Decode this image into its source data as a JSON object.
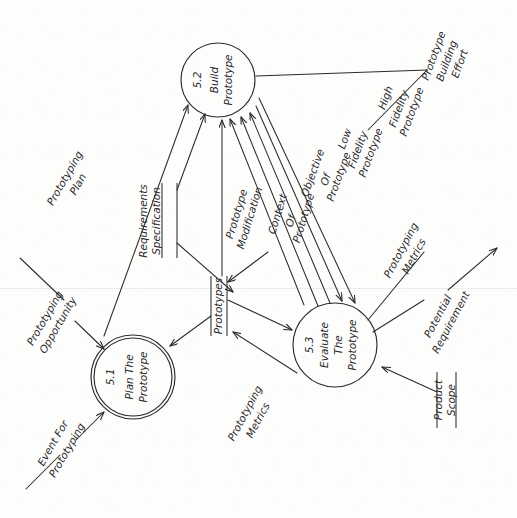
{
  "diagram": {
    "type": "data-flow-diagram",
    "orientation": "rotated-90-clockwise",
    "processes": [
      {
        "id": "5.1",
        "name_lines": [
          "Plan The",
          "Prototype"
        ],
        "shape": "double-circle",
        "cx": 133,
        "cy": 377,
        "r": 42
      },
      {
        "id": "5.2",
        "name_lines": [
          "Build",
          "Prototype"
        ],
        "shape": "circle",
        "cx": 218,
        "cy": 80,
        "r": 37
      },
      {
        "id": "5.3",
        "name_lines": [
          "Evaluate",
          "The",
          "Prototype"
        ],
        "shape": "circle",
        "cx": 335,
        "cy": 345,
        "r": 42
      }
    ],
    "data_stores": [
      {
        "name_lines": [
          "Requirements",
          "Specification"
        ],
        "x": 168,
        "y_top": 183,
        "y_bottom": 258
      },
      {
        "name_lines": [
          "Prototypes"
        ],
        "x": 218,
        "y_top": 276,
        "y_bottom": 336
      },
      {
        "name_lines": [
          "Product",
          "Scope"
        ],
        "x": 445,
        "y_top": 372,
        "y_bottom": 428
      }
    ],
    "flows": [
      {
        "label_lines": [
          "Prototyping",
          "Plan"
        ],
        "from": "5.1",
        "to": "5.2"
      },
      {
        "label_lines": [
          "Prototyping",
          "Opportunity"
        ],
        "from": "external",
        "to": "5.1"
      },
      {
        "label_lines": [
          "Event For",
          "Prototyping"
        ],
        "from": "external",
        "to": "5.1"
      },
      {
        "label_lines": [
          "Prototype",
          "Modification"
        ],
        "from": "5.3",
        "to": "5.2"
      },
      {
        "label_lines": [
          "Context",
          "Of",
          "Prototype"
        ],
        "from": "5.3",
        "to": "5.2"
      },
      {
        "label_lines": [
          "Objective",
          "Of",
          "Prototype"
        ],
        "from": "5.3",
        "to": "5.2"
      },
      {
        "label_lines": [
          "Low",
          "Fidelity",
          "Prototype"
        ],
        "from": "5.2",
        "to": "5.3"
      },
      {
        "label_lines": [
          "High",
          "Fidelity",
          "Prototype"
        ],
        "from": "5.2",
        "to": "5.3"
      },
      {
        "label_lines": [
          "Prototype",
          "Building",
          "Effort"
        ],
        "from": "5.2",
        "to": "external"
      },
      {
        "label_lines": [
          "Prototyping",
          "Metrics"
        ],
        "from": "5.3",
        "to": "external"
      },
      {
        "label_lines": [
          "Potential",
          "Requirement"
        ],
        "from": "5.3",
        "to": "external"
      },
      {
        "label_lines": [
          "Prototyping",
          "Metrics"
        ],
        "from": "Prototypes",
        "to": "5.3"
      }
    ]
  },
  "colors": {
    "ink": "#2b2b2b",
    "paper": "#fdfdfc"
  }
}
